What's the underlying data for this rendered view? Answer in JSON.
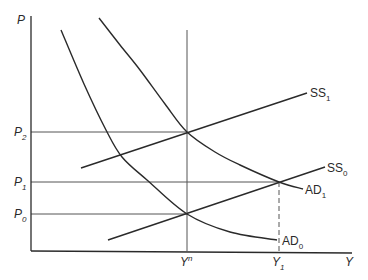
{
  "diagram": {
    "title": "",
    "type": "AD-SS price-output diagram",
    "colors": {
      "ink": "#2a2a2a",
      "guide": "#555555",
      "background": "#ffffff"
    },
    "axes": {
      "y_label": "P",
      "x_label": "Y",
      "origin": [
        31,
        251
      ],
      "y_top": 16,
      "x_right": 352
    },
    "y_ticks": [
      {
        "base": "P",
        "sub": "2",
        "y": 132
      },
      {
        "base": "P",
        "sub": "1",
        "y": 182
      },
      {
        "base": "P",
        "sub": "0",
        "y": 214
      }
    ],
    "x_ticks": [
      {
        "base": "Y",
        "sup": "n",
        "sub": "",
        "x": 187
      },
      {
        "base": "Y",
        "sup": "",
        "sub": "1",
        "x": 279
      }
    ],
    "curves": [
      {
        "id": "AD0",
        "base": "AD",
        "sub": "0",
        "kind": "aggregate-demand",
        "points": [
          [
            61,
            30
          ],
          [
            84,
            84
          ],
          [
            106,
            130
          ],
          [
            122,
            157
          ],
          [
            147,
            180
          ],
          [
            187,
            214
          ],
          [
            230,
            232
          ],
          [
            277,
            240
          ]
        ],
        "label_pos": [
          282,
          245
        ]
      },
      {
        "id": "AD1",
        "base": "AD",
        "sub": "1",
        "kind": "aggregate-demand",
        "points": [
          [
            99,
            18
          ],
          [
            120,
            45
          ],
          [
            140,
            70
          ],
          [
            165,
            104
          ],
          [
            187,
            132
          ],
          [
            215,
            152
          ],
          [
            240,
            165
          ],
          [
            279,
            182
          ],
          [
            303,
            189
          ]
        ],
        "label_pos": [
          305,
          194
        ]
      },
      {
        "id": "SS1",
        "base": "SS",
        "sub": "1",
        "kind": "supply",
        "points": [
          [
            81,
            168
          ],
          [
            307,
            93
          ]
        ],
        "label_pos": [
          310,
          97
        ]
      },
      {
        "id": "SS0",
        "base": "SS",
        "sub": "0",
        "kind": "supply",
        "points": [
          [
            108,
            240
          ],
          [
            325,
            167
          ]
        ],
        "label_pos": [
          327,
          172
        ]
      }
    ],
    "guides": [
      {
        "id": "p2-line",
        "from": [
          31,
          132
        ],
        "to": [
          187,
          132
        ],
        "style": "solid"
      },
      {
        "id": "p1-line",
        "from": [
          31,
          182
        ],
        "to": [
          279,
          182
        ],
        "style": "solid"
      },
      {
        "id": "p0-line",
        "from": [
          31,
          214
        ],
        "to": [
          187,
          214
        ],
        "style": "solid"
      },
      {
        "id": "yn-line",
        "from": [
          187,
          30
        ],
        "to": [
          187,
          251
        ],
        "style": "solid"
      },
      {
        "id": "y1-line",
        "from": [
          279,
          182
        ],
        "to": [
          279,
          251
        ],
        "style": "dashed"
      }
    ],
    "equilibria": [
      {
        "id": "eq-P2-Yn",
        "x": 187,
        "y": 132
      },
      {
        "id": "eq-P0-Yn",
        "x": 187,
        "y": 214
      },
      {
        "id": "eq-P1-Y1",
        "x": 279,
        "y": 182
      }
    ]
  }
}
